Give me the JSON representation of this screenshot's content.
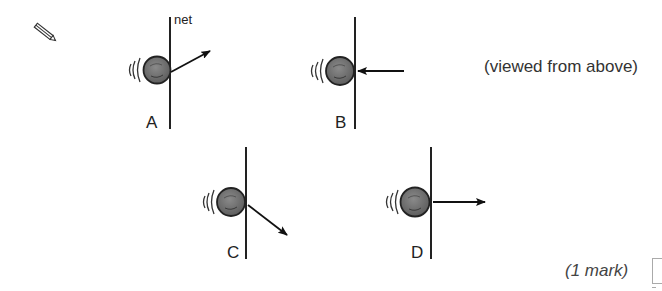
{
  "question": {
    "icon": "pencil-icon",
    "net_label": "net",
    "caption": "(viewed from above)",
    "marks": "(1 mark)",
    "options": [
      {
        "label": "A",
        "arrow_direction": "up-right (away from net)"
      },
      {
        "label": "B",
        "arrow_direction": "left (towards net)"
      },
      {
        "label": "C",
        "arrow_direction": "down-right (away from net)"
      },
      {
        "label": "D",
        "arrow_direction": "right (perpendicular away from net)"
      }
    ]
  },
  "colors": {
    "ink": "#222222",
    "ball_fill": "#6b6b6b",
    "ball_stroke": "#222222",
    "answer_box": "#aaaaaa"
  }
}
